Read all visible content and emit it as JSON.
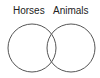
{
  "diagram": {
    "type": "venn",
    "sets": [
      {
        "label": "Horses",
        "cx": 32,
        "cy": 48,
        "r": 24
      },
      {
        "label": "Animals",
        "cx": 71,
        "cy": 48,
        "r": 24
      }
    ],
    "stroke_color": "#555555"
  }
}
